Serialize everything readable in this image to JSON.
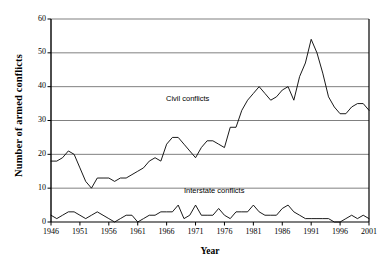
{
  "chart_data": {
    "type": "line",
    "title": "",
    "xlabel": "Year",
    "ylabel": "Number of armed conflicts",
    "xlim": [
      1946,
      2001
    ],
    "ylim": [
      0,
      60
    ],
    "grid": "horizontal",
    "legend_position": "in-plot annotations",
    "x_ticks": [
      "1946",
      "1951",
      "1956",
      "1961",
      "1966",
      "1971",
      "1976",
      "1981",
      "1986",
      "1991",
      "1996",
      "2001"
    ],
    "y_ticks": [
      "0",
      "10",
      "20",
      "30",
      "40",
      "50",
      "60"
    ],
    "x": [
      1946,
      1947,
      1948,
      1949,
      1950,
      1951,
      1952,
      1953,
      1954,
      1955,
      1956,
      1957,
      1958,
      1959,
      1960,
      1961,
      1962,
      1963,
      1964,
      1965,
      1966,
      1967,
      1968,
      1969,
      1970,
      1971,
      1972,
      1973,
      1974,
      1975,
      1976,
      1977,
      1978,
      1979,
      1980,
      1981,
      1982,
      1983,
      1984,
      1985,
      1986,
      1987,
      1988,
      1989,
      1990,
      1991,
      1992,
      1993,
      1994,
      1995,
      1996,
      1997,
      1998,
      1999,
      2000,
      2001
    ],
    "series": [
      {
        "name": "Civil conflicts",
        "values": [
          18,
          18,
          19,
          21,
          20,
          16,
          12,
          10,
          13,
          13,
          13,
          12,
          13,
          13,
          14,
          15,
          16,
          18,
          19,
          18,
          23,
          25,
          25,
          23,
          21,
          19,
          22,
          24,
          24,
          23,
          22,
          28,
          28,
          33,
          36,
          38,
          40,
          38,
          36,
          37,
          39,
          40,
          36,
          43,
          47,
          54,
          50,
          44,
          37,
          34,
          32,
          32,
          34,
          35,
          35,
          33
        ]
      },
      {
        "name": "Interstate conflicts",
        "values": [
          2,
          1,
          2,
          3,
          3,
          2,
          1,
          2,
          3,
          2,
          1,
          0,
          1,
          2,
          2,
          0,
          1,
          2,
          2,
          3,
          3,
          3,
          5,
          1,
          2,
          5,
          2,
          2,
          2,
          4,
          2,
          1,
          3,
          3,
          3,
          5,
          3,
          2,
          2,
          2,
          4,
          5,
          3,
          2,
          1,
          1,
          1,
          1,
          1,
          0,
          0,
          1,
          2,
          1,
          2,
          1
        ]
      }
    ],
    "annotations": [
      {
        "text": "Civil conflicts",
        "series": "Civil conflicts"
      },
      {
        "text": "Interstate conflicts",
        "series": "Interstate conflicts"
      }
    ]
  },
  "colors": {
    "line": "#000000",
    "gridline": "#808080",
    "axis": "#000000",
    "background": "#ffffff"
  }
}
